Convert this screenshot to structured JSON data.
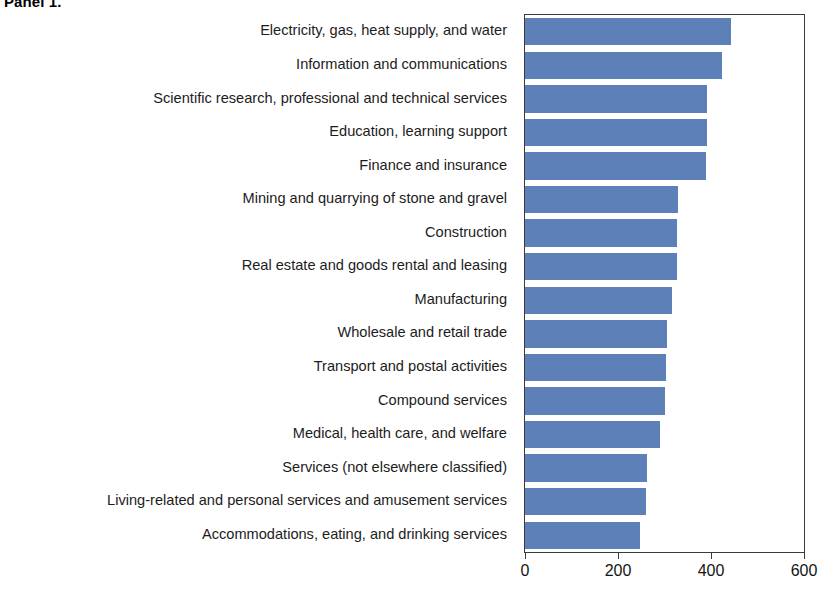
{
  "panel": {
    "title": "Panel 1."
  },
  "chart_data": {
    "type": "bar",
    "orientation": "horizontal",
    "title": "Panel 1.",
    "xlabel": "",
    "ylabel": "",
    "xlim": [
      0,
      600
    ],
    "xticks": [
      0,
      200,
      400,
      600
    ],
    "xtick_labels": [
      "0",
      "200",
      "400",
      "600"
    ],
    "grid": false,
    "legend": null,
    "bar_color": "#5c80b7",
    "axis_color": "#3b3b3b",
    "categories": [
      "Electricity, gas, heat supply, and water",
      "Information and communications",
      "Scientific research, professional and technical services",
      "Education, learning support",
      "Finance and insurance",
      "Mining and quarrying of stone and gravel",
      "Construction",
      "Real estate and goods rental and leasing",
      "Manufacturing",
      "Wholesale and retail trade",
      "Transport and postal activities",
      "Compound services",
      "Medical, health care, and welfare",
      "Services (not elsewhere classified)",
      "Living-related and personal services and amusement services",
      "Accommodations, eating, and drinking services"
    ],
    "values": [
      442,
      424,
      392,
      391,
      390,
      329,
      327,
      326,
      317,
      305,
      303,
      301,
      290,
      262,
      261,
      248
    ]
  },
  "xaxis": {
    "ticks": [
      {
        "label": "0",
        "value": 0
      },
      {
        "label": "200",
        "value": 200
      },
      {
        "label": "400",
        "value": 400
      },
      {
        "label": "600",
        "value": 600
      }
    ]
  }
}
